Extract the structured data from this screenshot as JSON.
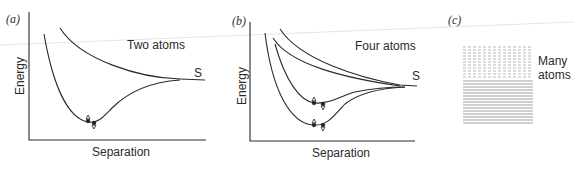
{
  "figure": {
    "panels": [
      {
        "id": "a",
        "label": "(a)",
        "title": "Two atoms",
        "xlabel": "Separation",
        "ylabel": "Energy",
        "limit_label": "S"
      },
      {
        "id": "b",
        "label": "(b)",
        "title": "Four atoms",
        "xlabel": "Separation",
        "ylabel": "Energy",
        "limit_label": "S"
      },
      {
        "id": "c",
        "label": "(c)",
        "title_line1": "Many",
        "title_line2": "atoms"
      }
    ],
    "colors": {
      "line": "#2a2a2a",
      "band": "#555555",
      "background": "#ffffff"
    }
  }
}
